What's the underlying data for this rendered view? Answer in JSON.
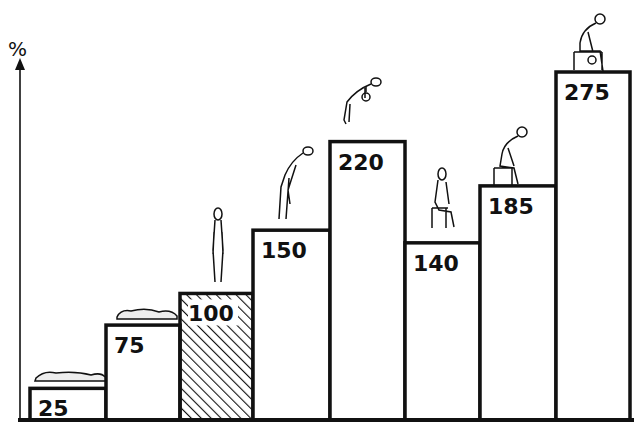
{
  "chart_data": {
    "type": "bar",
    "title": "",
    "xlabel": "",
    "ylabel": "%",
    "ylim": [
      0,
      300
    ],
    "grid": false,
    "legend": null,
    "categories": [
      "lying supine",
      "lying on side",
      "standing upright",
      "standing bent forward",
      "standing bent forward lifting weight",
      "sitting upright",
      "sitting bent forward",
      "sitting bent forward lifting weight"
    ],
    "values": [
      25,
      75,
      100,
      150,
      220,
      140,
      185,
      275
    ],
    "labels": [
      "25",
      "75",
      "100",
      "150",
      "220",
      "140",
      "185",
      "275"
    ],
    "highlighted_category": "standing upright",
    "highlight_style": "diagonal hatching (reference = 100%)",
    "annotations": "Each bar is topped with a line drawing of a person in the corresponding posture"
  },
  "axis": {
    "y_label": "%"
  },
  "colors": {
    "ink": "#111111",
    "background": "#ffffff"
  }
}
